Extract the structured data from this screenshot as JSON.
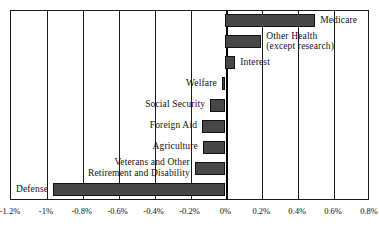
{
  "chart_data": {
    "type": "bar",
    "orientation": "horizontal",
    "title": "",
    "xlabel": "",
    "ylabel": "",
    "xlim": [
      -1.2,
      0.8
    ],
    "xticks": [
      -1.2,
      -1.0,
      -0.8,
      -0.6,
      -0.4,
      -0.2,
      0.0,
      0.2,
      0.4,
      0.6,
      0.8
    ],
    "xtick_labels": [
      "-1.2%",
      "-1%",
      "-0.8%",
      "-0.6%",
      "-0.4%",
      "-0.2%",
      "0%",
      "0.2%",
      "0.4%",
      "0.6%",
      "0.8%"
    ],
    "units": "percent",
    "grid": true,
    "legend": false,
    "bar_color": "#474747",
    "bar_edge_color": "#111111",
    "axis_color": "#1a1a1a",
    "categories": [
      "Medicare",
      "Other Health (except research)",
      "Interest",
      "Welfare",
      "Social Security",
      "Foreign Aid",
      "Agriculture",
      "Veterans and Other Retirement and Disability",
      "Defense"
    ],
    "values": [
      0.5,
      0.2,
      0.055,
      -0.02,
      -0.085,
      -0.13,
      -0.125,
      -0.17,
      -0.96
    ],
    "bars": [
      {
        "name": "Medicare",
        "label_lines": [
          "Medicare"
        ],
        "value": 0.5,
        "label_side": "right"
      },
      {
        "name": "Other Health (except research)",
        "label_lines": [
          "Other Health",
          "(except research)"
        ],
        "value": 0.2,
        "label_side": "right"
      },
      {
        "name": "Interest",
        "label_lines": [
          "Interest"
        ],
        "value": 0.055,
        "label_side": "right"
      },
      {
        "name": "Welfare",
        "label_lines": [
          "Welfare"
        ],
        "value": -0.02,
        "label_side": "left"
      },
      {
        "name": "Social Security",
        "label_lines": [
          "Social Security"
        ],
        "value": -0.085,
        "label_side": "left"
      },
      {
        "name": "Foreign Aid",
        "label_lines": [
          "Foreign Aid"
        ],
        "value": -0.13,
        "label_side": "left"
      },
      {
        "name": "Agriculture",
        "label_lines": [
          "Agriculture"
        ],
        "value": -0.125,
        "label_side": "left"
      },
      {
        "name": "Veterans and Other Retirement and Disability",
        "label_lines": [
          "Veterans and Other",
          "Retirement and Disability"
        ],
        "value": -0.17,
        "label_side": "left"
      },
      {
        "name": "Defense",
        "label_lines": [
          "Defense"
        ],
        "value": -0.96,
        "label_side": "left"
      }
    ]
  }
}
